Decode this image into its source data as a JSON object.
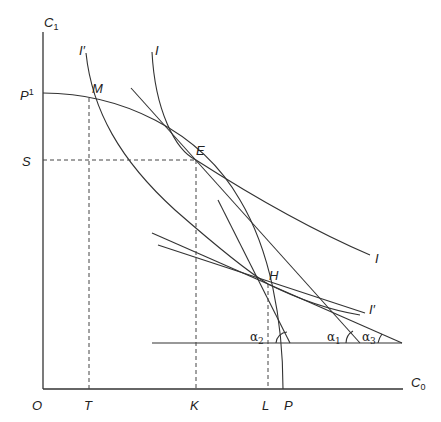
{
  "diagram": {
    "type": "intertemporal-consumption-diagram",
    "axes": {
      "y_label": "C",
      "y_label_sub": "1",
      "x_label": "C",
      "x_label_sub": "0",
      "origin_label": "O"
    },
    "y_axis_labels": {
      "p1": "P",
      "p1_sup": "1",
      "s": "S"
    },
    "x_axis_labels": {
      "t": "T",
      "k": "K",
      "l": "L",
      "p": "P"
    },
    "points": {
      "m": "M",
      "e": "E",
      "h": "H"
    },
    "curves": {
      "indiff_i_top": "I",
      "indiff_i_right": "I",
      "indiff_i_prime_top": "I′",
      "indiff_i_prime_right": "I′"
    },
    "angles": {
      "a1": "α",
      "a1_sub": "1",
      "a2": "α",
      "a2_sub": "2",
      "a3": "α",
      "a3_sub": "3"
    }
  }
}
